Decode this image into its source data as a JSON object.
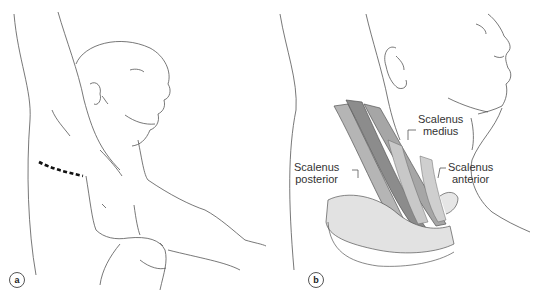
{
  "figure": {
    "panels": [
      {
        "id": "a",
        "label": "a"
      },
      {
        "id": "b",
        "label": "b"
      }
    ],
    "labels": {
      "scalenus_medius": [
        "Scalenus",
        "medius"
      ],
      "scalenus_posterior": [
        "Scalenus",
        "posterior"
      ],
      "scalenus_anterior": [
        "Scalenus",
        "anterior"
      ]
    },
    "colors": {
      "line": "#444444",
      "muscle": "#9a9a9a",
      "muscle_dark": "#7a7a7a",
      "incision": "#111111"
    }
  }
}
